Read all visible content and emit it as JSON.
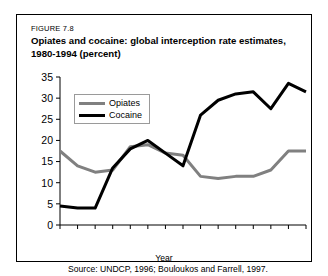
{
  "figure": {
    "number": "FIGURE 7.8",
    "title": "Opiates and cocaine: global interception rate estimates, 1980-1994 (percent)",
    "source": "Source: UNDCP, 1996; Bouloukos and Farrell, 1997."
  },
  "colors": {
    "opiates": "#808080",
    "cocaine": "#000000",
    "axis": "#000000",
    "frame": "#000000",
    "background": "#ffffff"
  },
  "legend": {
    "position": "top-left-inside",
    "entries": [
      {
        "label": "Opiates",
        "color": "#808080"
      },
      {
        "label": "Cocaine",
        "color": "#000000"
      }
    ]
  },
  "chart_data": {
    "type": "line",
    "title": "Opiates and cocaine: global interception rate estimates, 1980-1994 (percent)",
    "xlabel": "Year",
    "ylabel": "",
    "xlim": [
      1980,
      1994
    ],
    "ylim": [
      0,
      35
    ],
    "grid": false,
    "x": [
      1980,
      1981,
      1982,
      1983,
      1984,
      1985,
      1986,
      1987,
      1988,
      1989,
      1990,
      1991,
      1992,
      1993,
      1994
    ],
    "xticks": [
      1980,
      1982,
      1984,
      1986,
      1988,
      1990,
      1992,
      1994
    ],
    "xtick_labels": [
      "1980",
      "1982",
      "1984",
      "1986",
      "1988",
      "1990",
      "1992",
      "1994"
    ],
    "yticks": [
      0,
      5,
      10,
      15,
      20,
      25,
      30,
      35
    ],
    "ytick_labels": [
      "0",
      "5",
      "10",
      "15",
      "20",
      "25",
      "30",
      "35"
    ],
    "series": [
      {
        "name": "Opiates",
        "color": "#808080",
        "values": [
          17.5,
          14.0,
          12.5,
          13.0,
          18.5,
          19.0,
          17.0,
          16.5,
          11.5,
          11.0,
          11.5,
          11.5,
          13.0,
          17.5,
          17.5
        ]
      },
      {
        "name": "Cocaine",
        "color": "#000000",
        "values": [
          4.5,
          4.0,
          4.0,
          13.5,
          18.0,
          20.0,
          17.0,
          14.0,
          26.0,
          29.5,
          31.0,
          31.5,
          27.5,
          33.5,
          31.5
        ]
      }
    ]
  }
}
